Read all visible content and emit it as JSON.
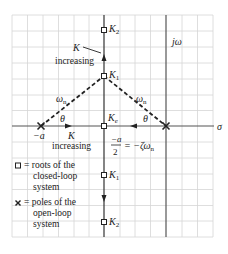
{
  "diagram": {
    "axes": {
      "imag_label": "jω",
      "real_label": "σ"
    },
    "points": {
      "left_pole_label": "−a",
      "center_label": "K",
      "center_sub": "e",
      "k1_upper": "K",
      "k1_sub": "1",
      "k2_upper": "K",
      "k2_sub": "2",
      "k1_lower": "K",
      "k2_lower": "K"
    },
    "annotations": {
      "k_increasing_top_k": "K",
      "k_increasing_top_text": "increasing",
      "k_increasing_bottom_k": "K",
      "k_increasing_bottom_text": "increasing",
      "omega_n_left": "ω",
      "omega_n_right": "ω",
      "omega_sub": "n",
      "theta": "θ",
      "fraction_num": "−a",
      "fraction_den": "2",
      "fraction_rhs": "= −ζω",
      "fraction_rhs_sub": "n"
    },
    "legend": [
      {
        "symbol": "□",
        "text_lines": [
          "= roots of the",
          "closed-loop",
          "system"
        ]
      },
      {
        "symbol": "×",
        "text_lines": [
          "= poles of the",
          "open-loop",
          "system"
        ]
      }
    ],
    "colors": {
      "grid": "#d8d8d8",
      "axis": "#555555",
      "locus": "#222222"
    }
  }
}
